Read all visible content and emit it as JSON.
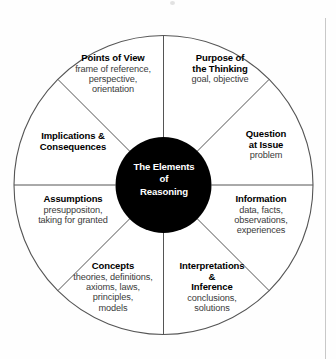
{
  "figure": {
    "background_color": "#fefefe",
    "outline_color": "#555555",
    "hub_color": "#000000",
    "hub_text_color": "#ffffff",
    "heading_color": "#000000",
    "body_color": "#3a3a3a"
  },
  "hub": {
    "line1": "The Elements",
    "line2": "of",
    "line3": "Reasoning"
  },
  "segments": [
    {
      "id": "points-of-view",
      "heading": "Points of View",
      "heading_lines": [
        "Points of View"
      ],
      "body_lines": [
        "frame of reference,",
        "perspective,",
        "orientation"
      ]
    },
    {
      "id": "purpose",
      "heading": "Purpose of the Thinking",
      "heading_lines": [
        "Purpose of",
        "the Thinking"
      ],
      "body_lines": [
        "goal, objective"
      ]
    },
    {
      "id": "question",
      "heading": "Question at Issue",
      "heading_lines": [
        "Question",
        "at Issue"
      ],
      "body_lines": [
        "problem"
      ]
    },
    {
      "id": "information",
      "heading": "Information",
      "heading_lines": [
        "Information"
      ],
      "body_lines": [
        "data, facts,",
        "observations,",
        "experiences"
      ]
    },
    {
      "id": "interpretations",
      "heading": "Interpretations & Inference",
      "heading_lines": [
        "Interpretations",
        "&",
        "Inference"
      ],
      "body_lines": [
        "conclusions,",
        "solutions"
      ]
    },
    {
      "id": "concepts",
      "heading": "Concepts",
      "heading_lines": [
        "Concepts"
      ],
      "body_lines": [
        "theories, definitions,",
        "axioms, laws,",
        "principles,",
        "models"
      ]
    },
    {
      "id": "assumptions",
      "heading": "Assumptions",
      "heading_lines": [
        "Assumptions"
      ],
      "body_lines": [
        "presuppositon,",
        "taking for granted"
      ]
    },
    {
      "id": "implications",
      "heading": "Implications & Consequences",
      "heading_lines": [
        "Implications &",
        "Consequences"
      ],
      "body_lines": []
    }
  ]
}
